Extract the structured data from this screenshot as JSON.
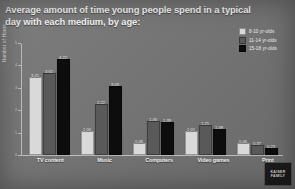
{
  "title": "Average amount of time young people spend in a typical day with each medium, by age:",
  "legend": {
    "position": "top-right",
    "items": [
      {
        "label": "8-10 yr-olds",
        "color": "#d9d9d9"
      },
      {
        "label": "11-14 yr-olds",
        "color": "#595959"
      },
      {
        "label": "15-18 yr-olds",
        "color": "#0d0d0d"
      }
    ]
  },
  "logo": {
    "line1": "KAISER",
    "line2": "FAMILY",
    "line3": "FOUNDATION"
  },
  "chart_data": {
    "type": "bar",
    "title": "Average amount of time young people spend in a typical day with each medium, by age:",
    "xlabel": "",
    "ylabel": "Number of Hours",
    "ylim": [
      0,
      5
    ],
    "yticks": [
      0,
      1,
      2,
      3,
      4,
      5
    ],
    "ytick_labels": [
      "0",
      "1",
      "2",
      "3",
      "4",
      "5"
    ],
    "grid": false,
    "categories": [
      "TV content",
      "Music",
      "Computers",
      "Video games",
      "Print"
    ],
    "series": [
      {
        "name": "8-10 yr-olds",
        "color": "#d9d9d9",
        "values": [
          3.41,
          1.0,
          0.46,
          1.01,
          0.46
        ]
      },
      {
        "name": "11-14 yr-olds",
        "color": "#595959",
        "values": [
          3.61,
          2.22,
          1.46,
          1.25,
          0.37
        ]
      },
      {
        "name": "15-18 yr-olds",
        "color": "#0d0d0d",
        "values": [
          4.22,
          3.03,
          1.39,
          1.08,
          0.23
        ]
      }
    ],
    "value_labels": [
      [
        "3.41",
        "3.61",
        "4.22"
      ],
      [
        "1.00",
        "2.22",
        "3.03"
      ],
      [
        "0.46",
        "1.46",
        "1.39"
      ],
      [
        "1.01",
        "1.25",
        "1.08"
      ],
      [
        "0.46",
        "0.37",
        "0.23"
      ]
    ]
  }
}
